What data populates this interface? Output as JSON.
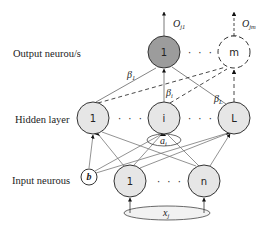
{
  "diagram": {
    "title": "",
    "layers": {
      "output": {
        "label": "Output neurou/s",
        "nodes": [
          {
            "id": "out-1",
            "label": "1",
            "style": "solid",
            "fill": "#9c9c9c",
            "output_label": "O",
            "output_sub": "j1"
          },
          {
            "id": "out-m",
            "label": "m",
            "style": "dashed",
            "fill": "#ffffff",
            "output_label": "O",
            "output_sub": "jm"
          }
        ],
        "ellipsis": "· · ·"
      },
      "hidden": {
        "label": "Hidden layer",
        "nodes": [
          {
            "id": "hid-1",
            "label": "1",
            "fill": "#e6e6e6"
          },
          {
            "id": "hid-i",
            "label": "i",
            "fill": "#e6e6e6"
          },
          {
            "id": "hid-L",
            "label": "L",
            "fill": "#e6e6e6"
          }
        ],
        "ellipsis_left": "· · ·",
        "ellipsis_right": "· · ·",
        "weight_label": "a",
        "weight_sub": "i"
      },
      "input": {
        "label": "Input neurous",
        "bias": {
          "id": "bias",
          "label": "b"
        },
        "nodes": [
          {
            "id": "in-1",
            "label": "1",
            "fill": "#e6e6e6"
          },
          {
            "id": "in-n",
            "label": "n",
            "fill": "#e6e6e6"
          }
        ],
        "ellipsis": "· · ·",
        "input_vector": {
          "label": "x",
          "sub": "j"
        }
      }
    },
    "edge_labels": [
      {
        "from": "hid-1",
        "label": "β",
        "sub": "1"
      },
      {
        "from": "hid-i",
        "label": "β",
        "sub": "i"
      },
      {
        "from": "hid-L",
        "label": "β",
        "sub": "L"
      }
    ],
    "colors": {
      "stroke": "#333333",
      "edge": "#666666",
      "output_fill": "#9c9c9c",
      "node_fill": "#e6e6e6"
    }
  }
}
